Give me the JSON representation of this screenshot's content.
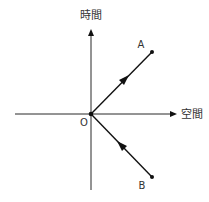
{
  "diagram": {
    "axes": {
      "time_label": "時間",
      "space_label": "空間",
      "origin_label": "O"
    },
    "points": [
      {
        "label": "A",
        "x": 152,
        "y": 52
      },
      {
        "label": "B",
        "x": 152,
        "y": 177
      }
    ],
    "origin": {
      "x": 91,
      "y": 114
    },
    "colors": {
      "stroke": "#111111",
      "text": "#333333",
      "background": "#ffffff"
    }
  }
}
